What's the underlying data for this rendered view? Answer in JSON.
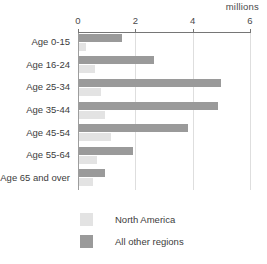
{
  "header": {
    "unit_label": "millions",
    "title_remnant": ""
  },
  "chart_data": {
    "type": "bar",
    "orientation": "horizontal",
    "title": "",
    "xlabel": "millions",
    "ylabel": "",
    "xlim": [
      0,
      6
    ],
    "xticks": [
      0,
      2,
      4,
      6
    ],
    "xtick_labels": [
      "0",
      "2",
      "4",
      "6"
    ],
    "grid": true,
    "legend_position": "bottom-left",
    "categories": [
      "Age 0-15",
      "Age 16-24",
      "Age 25-34",
      "Age 35-44",
      "Age 45-54",
      "Age 55-64",
      "Age 65 and over"
    ],
    "series": [
      {
        "name": "North America",
        "color": "#e3e3e3",
        "values": [
          0.25,
          0.55,
          0.77,
          0.9,
          1.1,
          0.62,
          0.5
        ]
      },
      {
        "name": "All other regions",
        "color": "#9a9a9a",
        "values": [
          1.5,
          2.6,
          4.95,
          4.85,
          3.8,
          1.9,
          0.9
        ]
      }
    ]
  },
  "legend": {
    "items": [
      {
        "label": "North America",
        "color": "#e3e3e3"
      },
      {
        "label": "All other regions",
        "color": "#9a9a9a"
      }
    ]
  }
}
